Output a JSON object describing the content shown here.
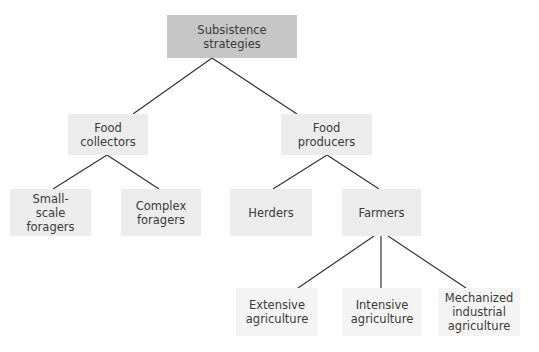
{
  "diagram": {
    "type": "tree",
    "nodes": {
      "root": {
        "label": "Subsistence\nstrategies"
      },
      "food_collectors": {
        "label": "Food\ncollectors"
      },
      "food_producers": {
        "label": "Food\nproducers"
      },
      "small_scale_foragers": {
        "label": "Small-\nscale\nforagers"
      },
      "complex_foragers": {
        "label": "Complex\nforagers"
      },
      "herders": {
        "label": "Herders"
      },
      "farmers": {
        "label": "Farmers"
      },
      "extensive_agriculture": {
        "label": "Extensive\nagriculture"
      },
      "intensive_agriculture": {
        "label": "Intensive\nagriculture"
      },
      "mechanized_industrial_agriculture": {
        "label": "Mechanized\nindustrial\nagriculture"
      }
    },
    "edges": [
      [
        "root",
        "food_collectors"
      ],
      [
        "root",
        "food_producers"
      ],
      [
        "food_collectors",
        "small_scale_foragers"
      ],
      [
        "food_collectors",
        "complex_foragers"
      ],
      [
        "food_producers",
        "herders"
      ],
      [
        "food_producers",
        "farmers"
      ],
      [
        "farmers",
        "extensive_agriculture"
      ],
      [
        "farmers",
        "intensive_agriculture"
      ],
      [
        "farmers",
        "mechanized_industrial_agriculture"
      ]
    ],
    "colors": {
      "root_fill": "#c6c6c6",
      "node_fill": "#ececec",
      "leaf_fill": "#f4f4f4",
      "line": "#333333",
      "text": "#3a3a3a"
    }
  }
}
